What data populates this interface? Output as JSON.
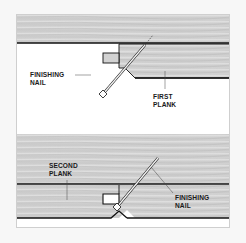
{
  "diagram": {
    "top_panel": {
      "labels": {
        "nail_line1": "FINISHING",
        "nail_line2": "NAIL",
        "plank_line1": "FIRST",
        "plank_line2": "PLANK"
      }
    },
    "bottom_panel": {
      "labels": {
        "plank_line1": "SECOND",
        "plank_line2": "PLANK",
        "nail_line1": "FINISHING",
        "nail_line2": "NAIL"
      }
    },
    "colors": {
      "background": "#f7f7f7",
      "frame": "#ffffff",
      "wood_light": "#d4d4d4",
      "wood_dark": "#b9b9b9",
      "outline": "#111111",
      "nail": "#e8e8e8"
    }
  }
}
